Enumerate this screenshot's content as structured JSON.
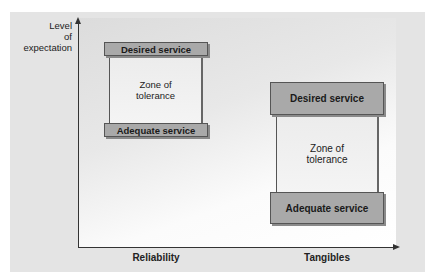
{
  "diagram": {
    "y_axis_label": [
      "Level",
      "of",
      "expectation"
    ],
    "x_axis_labels": [
      "Reliability",
      "Tangibles"
    ],
    "groups": [
      {
        "dimension": "Reliability",
        "desired_label": "Desired service",
        "zone_label": [
          "Zone of",
          "tolerance"
        ],
        "adequate_label": "Adequate service"
      },
      {
        "dimension": "Tangibles",
        "desired_label": "Desired service",
        "zone_label": [
          "Zone of",
          "tolerance"
        ],
        "adequate_label": "Adequate service"
      }
    ]
  },
  "colors": {
    "bar_fill": "#a9a9a9",
    "zone_fill": "#efefef",
    "panel_background": "#e4e4e4",
    "axis": "#333333"
  }
}
